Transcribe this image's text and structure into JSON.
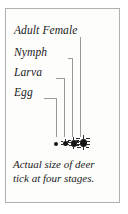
{
  "figure": {
    "kind": "deer-tick-life-stages-diagram",
    "border_color": "#b0b0b0",
    "background_color": "#fdfdfc",
    "text_color": "#1a1a1a",
    "leader_line_color": "#9a9a9a",
    "specimen_color": "#161616"
  },
  "stages": [
    {
      "id": "adult-female",
      "label": "Adult Female",
      "order": 4
    },
    {
      "id": "nymph",
      "label": "Nymph",
      "order": 3
    },
    {
      "id": "larva",
      "label": "Larva",
      "order": 2
    },
    {
      "id": "egg",
      "label": "Egg",
      "order": 1
    }
  ],
  "caption": {
    "line1": "Actual size of deer",
    "line2": "tick at four stages.",
    "full_text": "Actual size of deer tick at four stages."
  }
}
